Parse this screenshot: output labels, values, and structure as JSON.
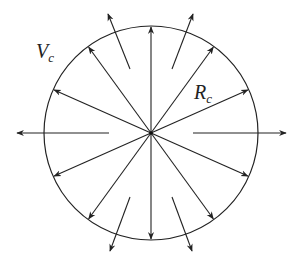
{
  "diagram": {
    "center": {
      "x": 151,
      "y": 133
    },
    "radius": 107,
    "colors": {
      "stroke": "#222222",
      "background": "#ffffff"
    },
    "labels": {
      "v": {
        "main": "V",
        "sub": "c"
      },
      "r": {
        "main": "R",
        "sub": "c"
      }
    },
    "inner_arrow_angles_deg": [
      90,
      54,
      24,
      -24,
      -54,
      -90,
      -126,
      -156,
      156,
      126
    ],
    "outer_arrows": [
      {
        "from": [
          109,
          133
        ],
        "to": [
          17,
          133
        ]
      },
      {
        "from": [
          193,
          133
        ],
        "to": [
          286,
          133
        ]
      },
      {
        "from": [
          130,
          69
        ],
        "to": [
          108,
          14
        ]
      },
      {
        "from": [
          172,
          69
        ],
        "to": [
          193,
          14
        ]
      },
      {
        "from": [
          130,
          197
        ],
        "to": [
          110,
          251
        ]
      },
      {
        "from": [
          172,
          197
        ],
        "to": [
          192,
          251
        ]
      }
    ]
  }
}
